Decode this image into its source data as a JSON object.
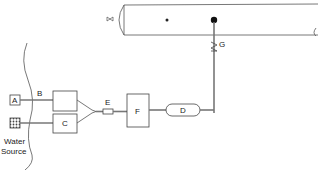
{
  "diagram": {
    "type": "water-supply-schematic",
    "labels": {
      "a": "A",
      "b": "B",
      "c": "C",
      "d": "D",
      "e": "E",
      "f": "F",
      "g": "G",
      "water_source_line1": "Water",
      "water_source_line2": "Source"
    },
    "components": [
      {
        "id": "A",
        "shape": "small-square"
      },
      {
        "id": "hatched",
        "shape": "small-square-hatched"
      },
      {
        "id": "B",
        "shape": "pipe-label"
      },
      {
        "id": "upper-box",
        "shape": "rectangle"
      },
      {
        "id": "C",
        "shape": "rectangle"
      },
      {
        "id": "E",
        "shape": "small-inline-fitting"
      },
      {
        "id": "F",
        "shape": "rectangle"
      },
      {
        "id": "D",
        "shape": "rounded-capsule"
      },
      {
        "id": "G",
        "shape": "valve-on-riser"
      },
      {
        "id": "tank",
        "shape": "horizontal-cylinder-tank"
      }
    ],
    "colors": {
      "line": "#555555",
      "pipe": "#777777",
      "background": "#ffffff"
    }
  }
}
